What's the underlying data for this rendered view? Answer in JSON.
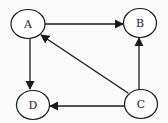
{
  "diagram": {
    "type": "directed-graph",
    "colors": {
      "stroke": "#1a1a1a",
      "node_fill": "#ffffff",
      "background": "#fbfbfb"
    },
    "nodes": [
      {
        "id": "A",
        "label": "A",
        "cx": 28,
        "cy": 24,
        "rx": 17,
        "ry": 14.5
      },
      {
        "id": "B",
        "label": "B",
        "cx": 140,
        "cy": 23,
        "rx": 16.5,
        "ry": 14.5
      },
      {
        "id": "C",
        "label": "C",
        "cx": 141,
        "cy": 104,
        "rx": 16.5,
        "ry": 14.5
      },
      {
        "id": "D",
        "label": "D",
        "cx": 33,
        "cy": 105,
        "rx": 16.5,
        "ry": 14.5
      }
    ],
    "edges": [
      {
        "from": "A",
        "to": "B"
      },
      {
        "from": "A",
        "to": "D"
      },
      {
        "from": "C",
        "to": "A"
      },
      {
        "from": "C",
        "to": "B"
      },
      {
        "from": "C",
        "to": "D"
      }
    ]
  }
}
